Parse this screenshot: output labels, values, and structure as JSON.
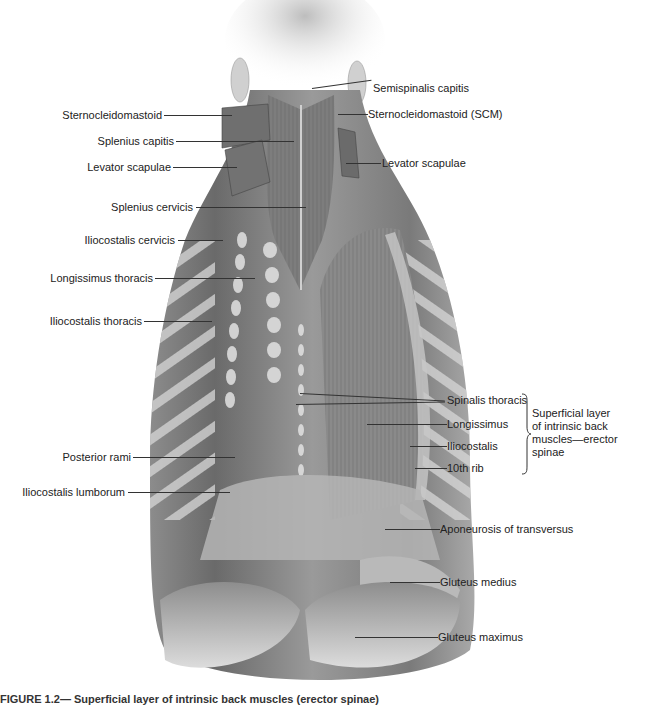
{
  "figure": {
    "type": "anatomical illustration",
    "colors": {
      "background": "#ffffff",
      "muscle_dark": "#5a5a5a",
      "muscle_mid": "#8a8a8a",
      "muscle_light": "#c8c8c8",
      "label_text": "#222222",
      "leader_line": "#333333"
    }
  },
  "labels_left": [
    {
      "text": "Sternocleidomastoid",
      "y": 115
    },
    {
      "text": "Splenius capitis",
      "y": 141
    },
    {
      "text": "Levator scapulae",
      "y": 167
    },
    {
      "text": "Splenius cervicis",
      "y": 207
    },
    {
      "text": "Iliocostalis cervicis",
      "y": 240
    },
    {
      "text": "Longissimus thoracis",
      "y": 278
    },
    {
      "text": "Iliocostalis thoracis",
      "y": 321
    },
    {
      "text": "Posterior rami",
      "y": 457
    },
    {
      "text": "Iliocostalis lumborum",
      "y": 492
    }
  ],
  "labels_right": [
    {
      "text": "Semispinalis capitis",
      "y": 88
    },
    {
      "text": "Sternocleidomastoid (SCM)",
      "y": 114
    },
    {
      "text": "Levator scapulae",
      "y": 163
    },
    {
      "text": "Spinalis thoracis",
      "y": 400
    },
    {
      "text": "Longissimus",
      "y": 424
    },
    {
      "text": "Iliocostalis",
      "y": 446
    },
    {
      "text": "10th rib",
      "y": 468
    },
    {
      "text": "Aponeurosis of transversus",
      "y": 529
    },
    {
      "text": "Gluteus medius",
      "y": 582
    },
    {
      "text": "Gluteus maximus",
      "y": 637
    }
  ],
  "group_label": {
    "lines": [
      "Superficial layer",
      "of intrinsic back",
      "muscles—erector",
      "spinae"
    ]
  },
  "caption": {
    "text": "FIGURE 1.2— Superficial layer of intrinsic back muscles (erector spinae)"
  }
}
